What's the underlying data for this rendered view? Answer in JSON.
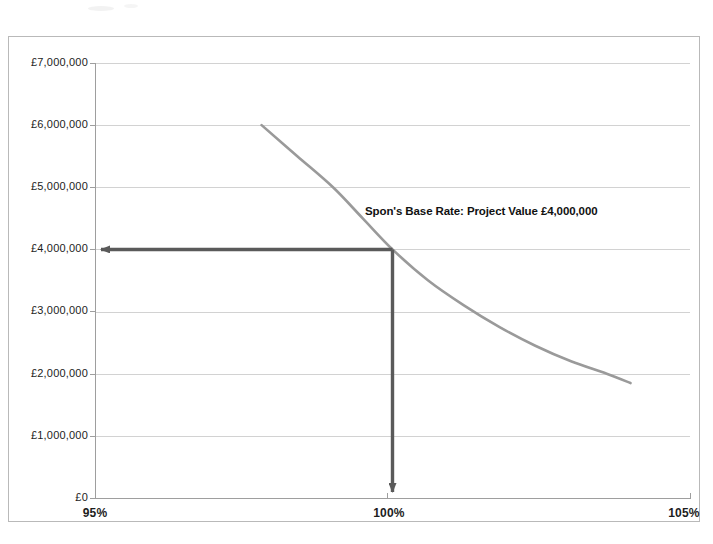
{
  "chart_data": {
    "type": "line",
    "title": "",
    "xlabel": "",
    "ylabel": "",
    "xlim": [
      95,
      105
    ],
    "ylim": [
      0,
      7000000
    ],
    "grid": true,
    "legend": "none",
    "x_ticks": [
      "95%",
      "100%",
      "105%"
    ],
    "x_tick_values": [
      95,
      100,
      105
    ],
    "y_ticks": [
      "£7,000,000",
      "£6,000,000",
      "£5,000,000",
      "£4,000,000",
      "£3,000,000",
      "£2,000,000",
      "£1,000,000",
      "£0"
    ],
    "y_tick_values": [
      7000000,
      6000000,
      5000000,
      4000000,
      3000000,
      2000000,
      1000000,
      0
    ],
    "series": [
      {
        "name": "Project Value curve",
        "color": "#9a9a9a",
        "x": [
          97.8,
          98.4,
          99.0,
          99.5,
          100.0,
          100.6,
          101.2,
          101.8,
          102.4,
          103.0,
          103.6,
          104.0
        ],
        "values": [
          6000000,
          5500000,
          5000000,
          4500000,
          4000000,
          3500000,
          3100000,
          2750000,
          2450000,
          2200000,
          2000000,
          1850000
        ]
      }
    ],
    "annotations": [
      {
        "name": "spons-base-rate-callout",
        "text": "Spon's Base Rate: Project Value £4,000,000",
        "x": 100.0,
        "y": 4000000
      }
    ],
    "markers": [
      {
        "name": "value-arrow-horizontal",
        "from_x": 100.0,
        "to_x": 95.0,
        "y": 4000000,
        "color": "#5a5a5a",
        "direction": "left"
      },
      {
        "name": "value-arrow-vertical",
        "x": 100.0,
        "from_y": 4000000,
        "to_y": 0,
        "color": "#5a5a5a",
        "direction": "down"
      }
    ],
    "colors": {
      "curve": "#9a9a9a",
      "arrow": "#5a5a5a",
      "grid": "#d2d2d2",
      "axis": "#9e9e9e",
      "frame": "#b9b9b9",
      "background": "#ffffff",
      "text": "#1d1d1d"
    }
  }
}
